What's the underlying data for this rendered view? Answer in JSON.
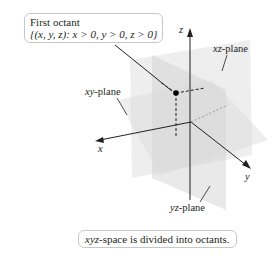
{
  "diagram": {
    "callout": {
      "title": "First octant",
      "set_notation": "{(x, y, z): x > 0, y > 0, z > 0}"
    },
    "axes": {
      "x": "x",
      "y": "y",
      "z": "z"
    },
    "planes": {
      "xy": {
        "var": "xy",
        "suffix": "-plane"
      },
      "xz": {
        "var": "xz",
        "suffix": "-plane"
      },
      "yz": {
        "var": "yz",
        "suffix": "-plane"
      }
    },
    "caption": {
      "var": "xyz",
      "text": "-space is divided into octants."
    },
    "colors": {
      "plane_fill": "#d9d9d9",
      "axis": "#231f20",
      "box_border": "#c8c8c8"
    }
  }
}
